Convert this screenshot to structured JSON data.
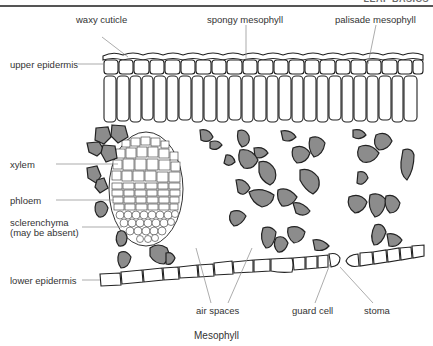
{
  "header": {
    "running_title": "LEAF BASICS"
  },
  "labels": {
    "waxy_cuticle": "waxy cuticle",
    "spongy_mesophyll": "spongy mesophyll",
    "palisade_mesophyll": "palisade mesophyll",
    "upper_epidermis": "upper epidermis",
    "xylem": "xylem",
    "phloem": "phloem",
    "sclerenchyma": "sclerenchyma",
    "sclerenchyma_note": "(may be absent)",
    "lower_epidermis": "lower epidermis",
    "air_spaces": "air spaces",
    "guard_cell": "guard cell",
    "stoma": "stoma"
  },
  "caption": "Mesophyll",
  "colors": {
    "outline": "#222222",
    "cell_fill": "#ffffff",
    "spongy_fill": "#8c8c8c",
    "leader_line": "#888888"
  }
}
